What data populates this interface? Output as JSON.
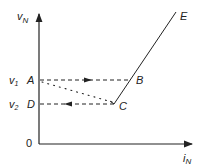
{
  "diagram": {
    "type": "v-i characteristic",
    "axes": {
      "y_label": "v",
      "y_label_sub": "N",
      "x_label": "i",
      "x_label_sub": "N",
      "origin_label": "0"
    },
    "levels": [
      {
        "label": "v",
        "sub": "1"
      },
      {
        "label": "v",
        "sub": "2"
      }
    ],
    "points": {
      "A": "A",
      "B": "B",
      "C": "C",
      "D": "D",
      "E": "E"
    },
    "paths": [
      {
        "from": "A",
        "to": "B",
        "style": "dashed",
        "arrow": "right"
      },
      {
        "from": "C",
        "to": "D",
        "style": "dashed",
        "arrow": "left"
      },
      {
        "from": "A",
        "to": "C",
        "style": "dotted"
      },
      {
        "from": "C",
        "to": "E",
        "style": "solid"
      }
    ]
  }
}
